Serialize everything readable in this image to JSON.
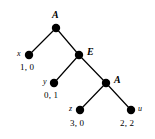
{
  "figure": {
    "type": "game-tree",
    "background_color": "#ffffff",
    "ink_color": "#000000",
    "node_radius_px": 4,
    "edge_width_px": 1.2
  },
  "nodes": [
    {
      "id": "root",
      "label": "A",
      "label_side": "above",
      "x": 56,
      "y": 28
    },
    {
      "id": "e",
      "label": "E",
      "label_side": "right",
      "x": 79,
      "y": 55
    },
    {
      "id": "a2",
      "label": "A",
      "label_side": "right",
      "x": 106,
      "y": 83
    }
  ],
  "leaves": [
    {
      "id": "x",
      "name": "x",
      "name_side": "left",
      "payoff": "1, 0",
      "x": 29,
      "y": 55
    },
    {
      "id": "y",
      "name": "y",
      "name_side": "left",
      "payoff": "0, 1",
      "x": 54,
      "y": 83
    },
    {
      "id": "z",
      "name": "z",
      "name_side": "left",
      "payoff": "3, 0",
      "x": 80,
      "y": 110
    },
    {
      "id": "u",
      "name": "u",
      "name_side": "right",
      "payoff": "2, 2",
      "x": 131,
      "y": 110
    }
  ],
  "edges": [
    {
      "from": "root",
      "to": "x"
    },
    {
      "from": "root",
      "to": "e"
    },
    {
      "from": "e",
      "to": "y"
    },
    {
      "from": "e",
      "to": "a2"
    },
    {
      "from": "a2",
      "to": "z"
    },
    {
      "from": "a2",
      "to": "u"
    }
  ],
  "labels": {
    "root_node": "A",
    "e_node": "E",
    "a2_node": "A",
    "leaf_x_name": "x",
    "leaf_x_payoff": "1, 0",
    "leaf_y_name": "y",
    "leaf_y_payoff": "0, 1",
    "leaf_z_name": "z",
    "leaf_z_payoff": "3, 0",
    "leaf_u_name": "u",
    "leaf_u_payoff": "2, 2"
  }
}
